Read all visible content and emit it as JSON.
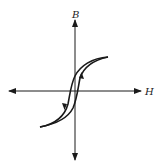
{
  "diagram": {
    "type": "hysteresis-loop",
    "axes": {
      "vertical_label": "B",
      "horizontal_label": "H"
    },
    "colors": {
      "ink": "#1a1a1a",
      "background": "#ffffff"
    },
    "curve": {
      "description": "Narrow S-shaped magnetic hysteresis loop passing near origin, saturating at upper-right and lower-left",
      "direction_arrows": [
        "upward on right branch",
        "downward on left branch"
      ]
    }
  }
}
